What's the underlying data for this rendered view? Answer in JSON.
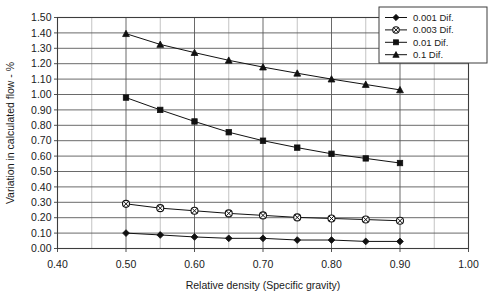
{
  "chart_data": {
    "type": "line",
    "title": "",
    "xlabel": "Relative density (Specific gravity)",
    "ylabel": "Variation in calculated flow - %",
    "xlim": [
      0.4,
      1.0
    ],
    "ylim": [
      0.0,
      1.5
    ],
    "x_major_step": 0.1,
    "x_minor_step": 0.05,
    "y_major_step": 0.1,
    "grid": true,
    "legend_position": "top-right",
    "x_tick_labels": [
      "0.40",
      "0.50",
      "0.60",
      "0.70",
      "0.80",
      "0.90",
      "1.00"
    ],
    "x_tick_values": [
      0.4,
      0.5,
      0.6,
      0.7,
      0.8,
      0.9,
      1.0
    ],
    "y_tick_labels": [
      "0.00",
      "0.10",
      "0.20",
      "0.30",
      "0.40",
      "0.50",
      "0.60",
      "0.70",
      "0.80",
      "0.90",
      "1.00",
      "1.10",
      "1.20",
      "1.30",
      "1.40",
      "1.50"
    ],
    "y_tick_values": [
      0.0,
      0.1,
      0.2,
      0.3,
      0.4,
      0.5,
      0.6,
      0.7,
      0.8,
      0.9,
      1.0,
      1.1,
      1.2,
      1.3,
      1.4,
      1.5
    ],
    "x": [
      0.5,
      0.55,
      0.6,
      0.65,
      0.7,
      0.75,
      0.8,
      0.85,
      0.9
    ],
    "series": [
      {
        "name": "0.001 Dif.",
        "marker": "diamond",
        "values": [
          0.1,
          0.088,
          0.075,
          0.066,
          0.066,
          0.055,
          0.055,
          0.046,
          0.046
        ]
      },
      {
        "name": "0.003 Dif.",
        "marker": "circle-cross",
        "values": [
          0.29,
          0.262,
          0.245,
          0.228,
          0.215,
          0.202,
          0.195,
          0.188,
          0.18
        ]
      },
      {
        "name": "0.01 Dif.",
        "marker": "square",
        "values": [
          0.98,
          0.9,
          0.825,
          0.755,
          0.7,
          0.655,
          0.615,
          0.585,
          0.555
        ]
      },
      {
        "name": "0.1 Dif.",
        "marker": "triangle",
        "values": [
          1.395,
          1.325,
          1.272,
          1.222,
          1.178,
          1.138,
          1.1,
          1.065,
          1.03
        ]
      }
    ]
  }
}
